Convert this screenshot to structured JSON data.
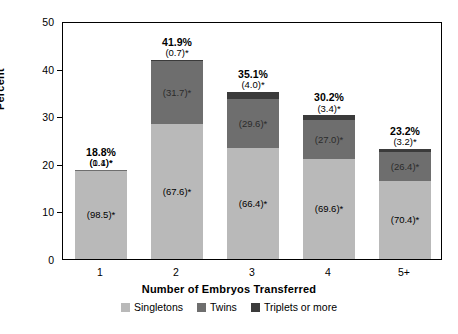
{
  "chart_data": {
    "type": "bar",
    "subtype": "stacked-bar",
    "title": "",
    "xlabel": "Number of Embryos Transferred",
    "ylabel": "Percent",
    "ylim": [
      0,
      50
    ],
    "yticks": [
      0,
      10,
      20,
      30,
      40,
      50
    ],
    "grid": false,
    "legend_position": "bottom",
    "categories": [
      "1",
      "2",
      "3",
      "4",
      "5+"
    ],
    "totals": [
      18.8,
      41.9,
      35.1,
      30.2,
      23.2
    ],
    "total_labels": [
      "18.8%",
      "41.9%",
      "35.1%",
      "30.2%",
      "23.2%"
    ],
    "series": [
      {
        "name": "Singletons",
        "color": "#b9b9b9",
        "values": [
          98.5,
          67.6,
          66.4,
          69.6,
          70.4
        ],
        "labels": [
          "(98.5)*",
          "(67.6)*",
          "(66.4)*",
          "(69.6)*",
          "(70.4)*"
        ]
      },
      {
        "name": "Twins",
        "color": "#6e6e6e",
        "values": [
          1.4,
          31.7,
          29.6,
          27.0,
          26.4
        ],
        "labels": [
          "(1.4)*",
          "(31.7)*",
          "(29.6)*",
          "(27.0)*",
          "(26.4)*"
        ]
      },
      {
        "name": "Triplets or more",
        "color": "#3b3b3b",
        "values": [
          0.1,
          0.7,
          4.0,
          3.4,
          3.2
        ],
        "labels": [
          "(0.1)*",
          "(0.7)*",
          "(4.0)*",
          "(3.4)*",
          "(3.2)*"
        ]
      }
    ],
    "note": "Segment values in parentheses are percent distributions within each bar."
  },
  "axis": {
    "y_title": "Percent",
    "x_title": "Number of Embryos Transferred",
    "yticks": [
      "50",
      "40",
      "30",
      "20",
      "10",
      "0"
    ],
    "xticks": [
      "1",
      "2",
      "3",
      "4",
      "5+"
    ]
  },
  "legend": {
    "items": [
      {
        "label": "Singletons",
        "color": "#b9b9b9"
      },
      {
        "label": "Twins",
        "color": "#6e6e6e"
      },
      {
        "label": "Triplets or more",
        "color": "#3b3b3b"
      }
    ]
  },
  "caption": {
    "text": ""
  }
}
